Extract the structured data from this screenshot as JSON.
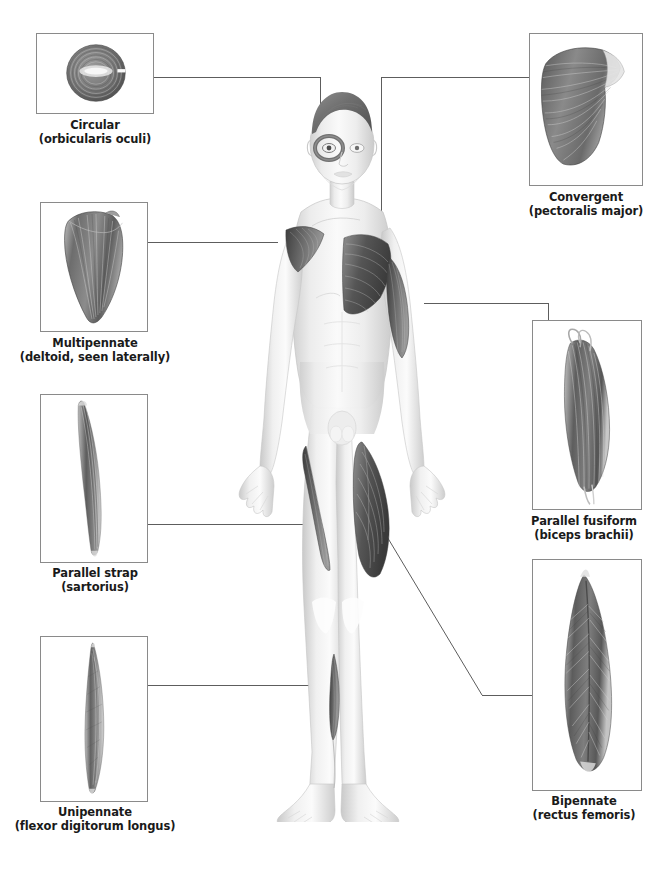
{
  "panels": [
    {
      "id": "circular",
      "name": "Circular",
      "muscle": "(orbicularis oculi)",
      "illustration": "circular-muscle-illustration",
      "box": {
        "x": 36,
        "y": 33,
        "w": 118,
        "h": 81
      },
      "caption": {
        "x": 20,
        "y": 118,
        "w": 150
      }
    },
    {
      "id": "multipennate",
      "name": "Multipennate",
      "muscle": "(deltoid, seen laterally)",
      "illustration": "multipennate-muscle-illustration",
      "box": {
        "x": 40,
        "y": 202,
        "w": 108,
        "h": 130
      },
      "caption": {
        "x": 12,
        "y": 336,
        "w": 166
      }
    },
    {
      "id": "parallel-strap",
      "name": "Parallel strap",
      "muscle": "(sartorius)",
      "illustration": "parallel-strap-muscle-illustration",
      "box": {
        "x": 40,
        "y": 394,
        "w": 108,
        "h": 169
      },
      "caption": {
        "x": 20,
        "y": 566,
        "w": 150
      }
    },
    {
      "id": "unipennate",
      "name": "Unipennate",
      "muscle": "(flexor digitorum longus)",
      "illustration": "unipennate-muscle-illustration",
      "box": {
        "x": 40,
        "y": 636,
        "w": 108,
        "h": 166
      },
      "caption": {
        "x": 14,
        "y": 805,
        "w": 162
      }
    },
    {
      "id": "convergent",
      "name": "Convergent",
      "muscle": "(pectoralis major)",
      "illustration": "convergent-muscle-illustration",
      "box": {
        "x": 529,
        "y": 33,
        "w": 114,
        "h": 153
      },
      "caption": {
        "x": 506,
        "y": 190,
        "w": 160
      }
    },
    {
      "id": "parallel-fusiform",
      "name": "Parallel fusiform",
      "muscle": "(biceps brachii)",
      "illustration": "parallel-fusiform-muscle-illustration",
      "box": {
        "x": 532,
        "y": 320,
        "w": 110,
        "h": 190
      },
      "caption": {
        "x": 502,
        "y": 514,
        "w": 164
      }
    },
    {
      "id": "bipennate",
      "name": "Bipennate",
      "muscle": "(rectus femoris)",
      "illustration": "bipennate-muscle-illustration",
      "box": {
        "x": 532,
        "y": 559,
        "w": 110,
        "h": 232
      },
      "caption": {
        "x": 504,
        "y": 794,
        "w": 160
      }
    }
  ],
  "colors": {
    "leader_line": "#5d5d5d",
    "panel_border": "#8a8a8a",
    "caption_text": "#1a1a1a",
    "muscle_dark": "#4a4a4a",
    "muscle_mid": "#8c8c8c",
    "skin_light": "#f2f2f2",
    "skin_shade": "#d6d6d6",
    "background": "#ffffff"
  }
}
